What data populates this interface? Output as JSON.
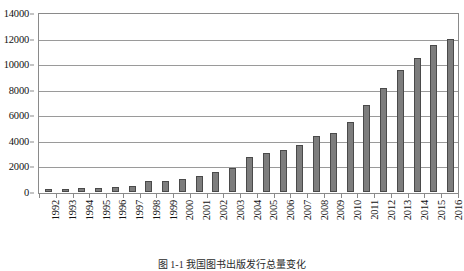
{
  "caption": "图 1-1  我国图书出版发行总量变化",
  "axes": {
    "y_ticks": [
      "0",
      "2000",
      "4000",
      "6000",
      "8000",
      "10000",
      "12000",
      "14000"
    ]
  },
  "chart_data": {
    "type": "bar",
    "title": "",
    "subtitle": "",
    "xlabel": "",
    "ylabel": "",
    "ylim": [
      0,
      14000
    ],
    "yticks": [
      0,
      2000,
      4000,
      6000,
      8000,
      10000,
      12000,
      14000
    ],
    "grid": true,
    "legend": false,
    "legend_position": "none",
    "bar_color": "#7d7d7d",
    "bar_edge_color": "#4a4a4a",
    "categories": [
      "1992",
      "1993",
      "1994",
      "1995",
      "1996",
      "1997",
      "1998",
      "1999",
      "2000",
      "2001",
      "2002",
      "2003",
      "2004",
      "2005",
      "2006",
      "2007",
      "2008",
      "2009",
      "2010",
      "2011",
      "2012",
      "2013",
      "2014",
      "2015",
      "2016"
    ],
    "values": [
      230,
      260,
      300,
      330,
      400,
      480,
      850,
      900,
      1000,
      1250,
      1550,
      1900,
      2700,
      3050,
      3300,
      3650,
      4350,
      4600,
      5500,
      6800,
      8150,
      9550,
      10500,
      11500,
      12000
    ]
  }
}
